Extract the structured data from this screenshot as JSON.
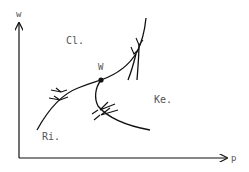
{
  "diagram": {
    "axes": {
      "y_label": "w",
      "x_label": "p"
    },
    "regions": [
      {
        "id": "cl",
        "label": "Cl."
      },
      {
        "id": "ke",
        "label": "Ke."
      },
      {
        "id": "ri",
        "label": "Ri."
      }
    ],
    "point": {
      "label": "W"
    },
    "colors": {
      "line": "#111111",
      "text": "#555555",
      "background": "#ffffff"
    }
  }
}
